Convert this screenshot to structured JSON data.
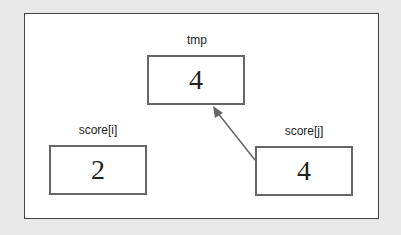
{
  "diagram": {
    "nodes": [
      {
        "id": "tmp",
        "label": "tmp",
        "value": "4"
      },
      {
        "id": "score_i",
        "label": "score[i]",
        "value": "2"
      },
      {
        "id": "score_j",
        "label": "score[j]",
        "value": "4"
      }
    ],
    "edges": [
      {
        "from": "score_j",
        "to": "tmp"
      }
    ],
    "colors": {
      "background": "#e9e9e9",
      "panel": "#ffffff",
      "border": "#666666",
      "arrow": "#666666"
    }
  }
}
